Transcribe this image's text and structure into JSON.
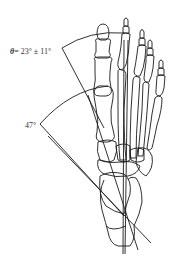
{
  "figure": {
    "colors": {
      "stroke": "#1a1a1a",
      "text": "#333333",
      "background": "#ffffff"
    }
  },
  "annotations": {
    "theta_symbol": "θ",
    "theta_expr": "= 23° ± 11°",
    "angle_47": "47°"
  },
  "angles": [
    {
      "label": "θ",
      "value_deg": 23,
      "tolerance_deg": 11
    },
    {
      "label": "",
      "value_deg": 47
    }
  ]
}
